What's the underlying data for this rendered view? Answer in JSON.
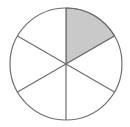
{
  "figure": {
    "name": "fraction-circle-diagram",
    "shape": "circle",
    "title": "",
    "total_sectors": 6,
    "shaded_sectors": 1,
    "fraction_label": "1/6",
    "sector_angle_degrees": 60,
    "geometry": {
      "center_x": 66,
      "center_y": 64,
      "radius": 56,
      "view_width": 130,
      "view_height": 127
    },
    "colors": {
      "background": "#ffffff",
      "stroke": "#6e6e6e",
      "shaded_fill": "#c9c9c9",
      "unshaded_fill": "#ffffff"
    },
    "stroke_width": 1.2,
    "divider_lines": [
      {
        "name": "vertical-diameter",
        "angle_degrees": 90
      },
      {
        "name": "diagonal-upper-right-to-lower-left",
        "angle_degrees": 30
      },
      {
        "name": "diagonal-upper-left-to-lower-right",
        "angle_degrees": 150
      }
    ],
    "sectors": [
      {
        "name": "sector-1",
        "position": "upper-right",
        "start_angle": 60,
        "end_angle": 90,
        "shaded": true
      },
      {
        "name": "sector-2",
        "position": "right",
        "start_angle": 0,
        "end_angle": 60,
        "shaded": false
      },
      {
        "name": "sector-3",
        "position": "lower-right",
        "start_angle": -60,
        "end_angle": 0,
        "shaded": false
      },
      {
        "name": "sector-4",
        "position": "lower-left",
        "start_angle": -120,
        "end_angle": -60,
        "shaded": false
      },
      {
        "name": "sector-5",
        "position": "left",
        "start_angle": -180,
        "end_angle": -120,
        "shaded": false
      },
      {
        "name": "sector-6",
        "position": "upper-left",
        "start_angle": 90,
        "end_angle": 180,
        "shaded": false
      }
    ]
  }
}
